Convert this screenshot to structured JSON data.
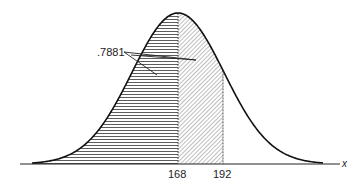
{
  "chart_data": {
    "type": "area",
    "title": "",
    "xlabel": "x",
    "ylabel": "",
    "x_ticks": [
      "168",
      "192"
    ],
    "annotations": [
      {
        "text": ".7881",
        "points_to": [
          "region left of 168",
          "region between 168 and 192"
        ]
      }
    ],
    "regions": [
      {
        "name": "left-of-168",
        "from": null,
        "to": 168,
        "fill": "horizontal-hatch"
      },
      {
        "name": "168-to-192",
        "from": 168,
        "to": 192,
        "fill": "diagonal-hatch"
      }
    ],
    "mean": 168,
    "area_label": 0.7881,
    "grid": false,
    "legend": "none"
  },
  "labels": {
    "area": ".7881",
    "tick_168": "168",
    "tick_192": "192",
    "axis_x": "x"
  }
}
